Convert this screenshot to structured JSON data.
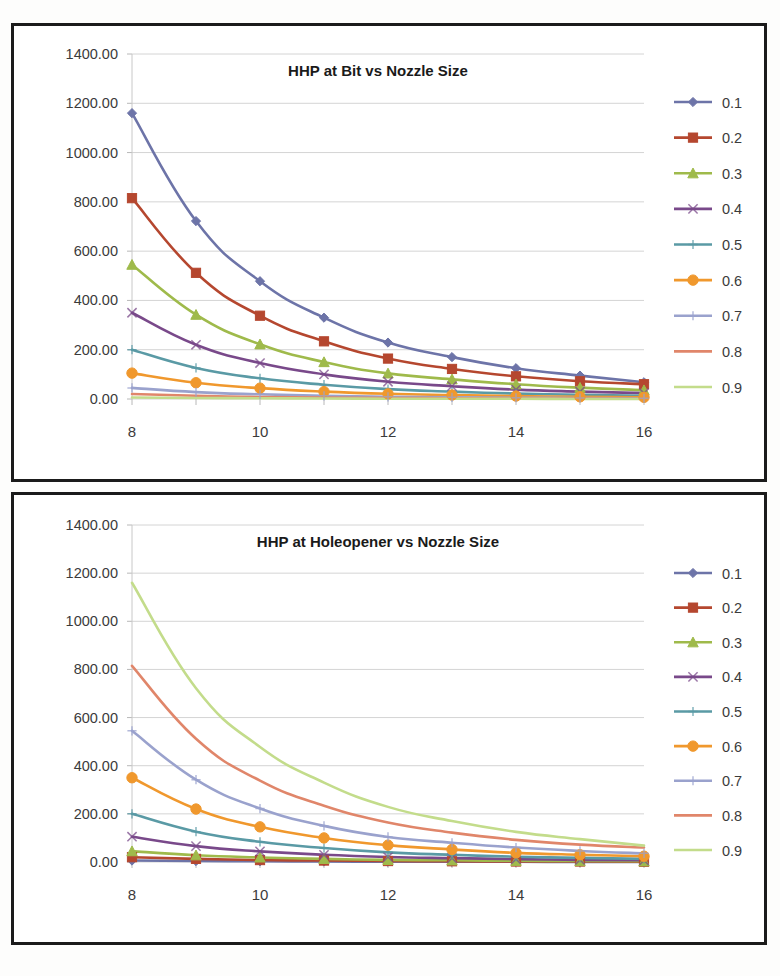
{
  "page": {
    "background": "#fdfdfc",
    "border_color": "#1b1b1b"
  },
  "charts": [
    {
      "id": "chart-top",
      "title": "HHP at Bit vs Nozzle Size"
    },
    {
      "id": "chart-bottom",
      "title": "HHP at Holeopener vs Nozzle Size"
    }
  ],
  "axis": {
    "y_ticks": [
      "0.00",
      "200.00",
      "400.00",
      "600.00",
      "800.00",
      "1000.00",
      "1200.00",
      "1400.00"
    ],
    "x_ticks": [
      "8",
      "10",
      "12",
      "14",
      "16"
    ]
  },
  "chart_data": [
    {
      "type": "line",
      "title": "HHP at Bit vs Nozzle Size",
      "xlabel": "",
      "ylabel": "",
      "x": [
        8,
        9,
        10,
        11,
        12,
        13,
        14,
        15,
        16
      ],
      "xlim": [
        8,
        16
      ],
      "ylim": [
        0,
        1400
      ],
      "ytick_values": [
        0,
        200,
        400,
        600,
        800,
        1000,
        1200,
        1400
      ],
      "ytick_labels": [
        "0.00",
        "200.00",
        "400.00",
        "600.00",
        "800.00",
        "1000.00",
        "1200.00",
        "1400.00"
      ],
      "xtick_values": [
        8,
        10,
        12,
        14,
        16
      ],
      "xtick_labels": [
        "8",
        "10",
        "12",
        "14",
        "16"
      ],
      "grid": true,
      "legend_position": "right",
      "series": [
        {
          "name": "0.1",
          "color": "#6d74a8",
          "marker": "diamond",
          "values": [
            1160,
            722,
            478,
            330,
            229,
            170,
            125,
            95,
            68
          ]
        },
        {
          "name": "0.2",
          "color": "#b5472f",
          "marker": "square",
          "values": [
            815,
            512,
            338,
            234,
            164,
            122,
            92,
            72,
            60
          ]
        },
        {
          "name": "0.3",
          "color": "#9fba4b",
          "marker": "triangle",
          "values": [
            545,
            342,
            222,
            150,
            104,
            80,
            60,
            46,
            36
          ]
        },
        {
          "name": "0.4",
          "color": "#79498a",
          "marker": "x",
          "values": [
            350,
            220,
            146,
            100,
            70,
            52,
            38,
            30,
            24
          ]
        },
        {
          "name": "0.5",
          "color": "#5a9aa5",
          "marker": "plus",
          "values": [
            200,
            126,
            84,
            58,
            40,
            30,
            22,
            17,
            13
          ]
        },
        {
          "name": "0.6",
          "color": "#f0982d",
          "marker": "circle",
          "values": [
            105,
            66,
            44,
            30,
            21,
            16,
            12,
            9,
            7
          ]
        },
        {
          "name": "0.7",
          "color": "#9aa2cd",
          "marker": "plus",
          "values": [
            45,
            28,
            19,
            13,
            9,
            7,
            5,
            4,
            3
          ]
        },
        {
          "name": "0.8",
          "color": "#e0866a",
          "marker": "none",
          "values": [
            20,
            13,
            8,
            6,
            4,
            3,
            2,
            2,
            1
          ]
        },
        {
          "name": "0.9",
          "color": "#c3dc8b",
          "marker": "none",
          "values": [
            6,
            4,
            3,
            2,
            1,
            1,
            1,
            0,
            0
          ]
        }
      ]
    },
    {
      "type": "line",
      "title": "HHP at Holeopener vs Nozzle Size",
      "xlabel": "",
      "ylabel": "",
      "x": [
        8,
        9,
        10,
        11,
        12,
        13,
        14,
        15,
        16
      ],
      "xlim": [
        8,
        16
      ],
      "ylim": [
        0,
        1400
      ],
      "ytick_values": [
        0,
        200,
        400,
        600,
        800,
        1000,
        1200,
        1400
      ],
      "ytick_labels": [
        "0.00",
        "200.00",
        "400.00",
        "600.00",
        "800.00",
        "1000.00",
        "1200.00",
        "1400.00"
      ],
      "xtick_values": [
        8,
        10,
        12,
        14,
        16
      ],
      "xtick_labels": [
        "8",
        "10",
        "12",
        "14",
        "16"
      ],
      "grid": true,
      "legend_position": "right",
      "series": [
        {
          "name": "0.1",
          "color": "#6d74a8",
          "marker": "diamond",
          "values": [
            6,
            4,
            3,
            2,
            1,
            1,
            1,
            0,
            0
          ]
        },
        {
          "name": "0.2",
          "color": "#b5472f",
          "marker": "square",
          "values": [
            20,
            13,
            8,
            6,
            4,
            3,
            2,
            2,
            1
          ]
        },
        {
          "name": "0.3",
          "color": "#9fba4b",
          "marker": "triangle",
          "values": [
            45,
            28,
            19,
            13,
            9,
            7,
            5,
            4,
            3
          ]
        },
        {
          "name": "0.4",
          "color": "#79498a",
          "marker": "x",
          "values": [
            105,
            66,
            44,
            30,
            21,
            16,
            12,
            9,
            7
          ]
        },
        {
          "name": "0.5",
          "color": "#5a9aa5",
          "marker": "plus",
          "values": [
            200,
            126,
            84,
            58,
            40,
            30,
            22,
            17,
            13
          ]
        },
        {
          "name": "0.6",
          "color": "#f0982d",
          "marker": "circle",
          "values": [
            350,
            220,
            146,
            100,
            70,
            52,
            38,
            30,
            24
          ]
        },
        {
          "name": "0.7",
          "color": "#9aa2cd",
          "marker": "plus",
          "values": [
            545,
            342,
            222,
            150,
            104,
            80,
            60,
            46,
            36
          ]
        },
        {
          "name": "0.8",
          "color": "#e0866a",
          "marker": "none",
          "values": [
            815,
            512,
            338,
            234,
            164,
            122,
            92,
            72,
            60
          ]
        },
        {
          "name": "0.9",
          "color": "#c3dc8b",
          "marker": "none",
          "values": [
            1160,
            722,
            478,
            330,
            229,
            170,
            125,
            95,
            68
          ]
        }
      ]
    }
  ]
}
